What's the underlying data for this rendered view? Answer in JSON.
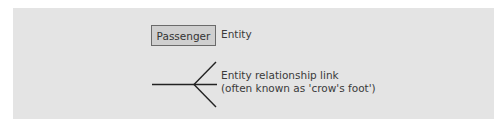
{
  "legend": {
    "entity": {
      "box_label": "Passenger",
      "description": "Entity"
    },
    "relationship_link": {
      "symbol": "crows-foot",
      "description_line1": "Entity relationship link",
      "description_line2": "(often known as 'crow's foot')"
    }
  },
  "colors": {
    "panel_background": "#e4e4e4",
    "entity_box_fill": "#cfcfcf",
    "entity_box_border": "#6a6a6a",
    "line_color": "#222222",
    "text_color": "#3a3a3a"
  }
}
